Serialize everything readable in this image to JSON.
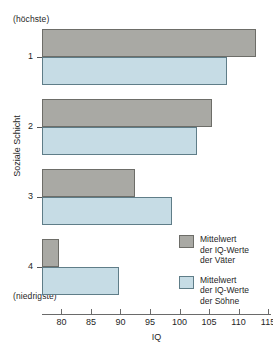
{
  "chart_data": {
    "type": "bar",
    "orientation": "horizontal",
    "title": "",
    "xlabel": "IQ",
    "ylabel": "Soziale Schicht",
    "xlim": [
      76.7,
      115.5
    ],
    "xticks": [
      80,
      85,
      90,
      95,
      100,
      105,
      110,
      115
    ],
    "xtick_labels": [
      "80",
      "85",
      "90",
      "95",
      "100",
      "105",
      "110",
      "115"
    ],
    "grid": false,
    "categories": [
      "1",
      "2",
      "3",
      "4"
    ],
    "category_top_note": "(höchste)",
    "category_bottom_note": "(niedrigste)",
    "bar_baseline": 76.7,
    "series": [
      {
        "name": "Mittelwert der IQ-Werte der Väter",
        "color": "#a9a9a4",
        "values": [
          113.0,
          105.5,
          92.5,
          79.5
        ]
      },
      {
        "name": "Mittelwert der IQ-Werte der Söhne",
        "color": "#c6dce5",
        "values": [
          108.0,
          103.0,
          98.7,
          89.8
        ]
      }
    ],
    "legend_position": "bottom-right",
    "legend": [
      {
        "key": "fathers",
        "lines": [
          "Mittelwert",
          "der IQ-Werte",
          "der Väter"
        ]
      },
      {
        "key": "sons",
        "lines": [
          "Mittelwert",
          "der IQ-Werte",
          "der Söhne"
        ]
      }
    ]
  }
}
